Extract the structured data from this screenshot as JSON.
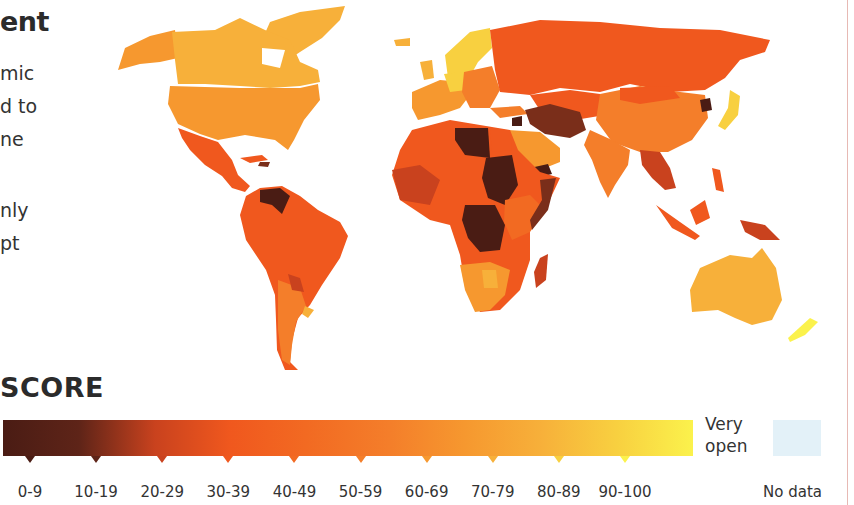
{
  "page": {
    "title_fragment": "ent",
    "body_fragments": [
      "mic",
      "d to",
      "ne",
      "",
      "nly",
      "pt"
    ]
  },
  "map": {
    "type": "choropleth-world-map",
    "description": "World countries shaded by openness score",
    "regions": [
      {
        "name": "North America (Canada)",
        "band": "70-79"
      },
      {
        "name": "United States",
        "band": "60-69"
      },
      {
        "name": "Greenland",
        "band": "70-79"
      },
      {
        "name": "Mexico / Central America",
        "band": "40-49"
      },
      {
        "name": "Venezuela",
        "band": "0-9"
      },
      {
        "name": "South America (Brazil, Colombia, Peru)",
        "band": "40-49"
      },
      {
        "name": "Argentina",
        "band": "50-59"
      },
      {
        "name": "Paraguay",
        "band": "20-29"
      },
      {
        "name": "Uruguay",
        "band": "70-79"
      },
      {
        "name": "Nordic countries",
        "band": "80-89"
      },
      {
        "name": "Western Europe",
        "band": "60-69"
      },
      {
        "name": "Eastern Europe",
        "band": "50-59"
      },
      {
        "name": "Russia",
        "band": "40-49"
      },
      {
        "name": "Central Asia",
        "band": "40-49"
      },
      {
        "name": "China",
        "band": "50-59"
      },
      {
        "name": "North Korea",
        "band": "0-9"
      },
      {
        "name": "Japan",
        "band": "80-89"
      },
      {
        "name": "India",
        "band": "50-59"
      },
      {
        "name": "Afghanistan / Iran",
        "band": "10-19"
      },
      {
        "name": "Saudi Arabia",
        "band": "60-69"
      },
      {
        "name": "Yemen",
        "band": "0-9"
      },
      {
        "name": "Libya",
        "band": "0-9"
      },
      {
        "name": "Sudan / South Sudan",
        "band": "0-9"
      },
      {
        "name": "DR Congo / CAR",
        "band": "0-9"
      },
      {
        "name": "North & West Africa",
        "band": "30-39"
      },
      {
        "name": "East Africa",
        "band": "40-49"
      },
      {
        "name": "Southern Africa",
        "band": "60-69"
      },
      {
        "name": "Madagascar",
        "band": "30-39"
      },
      {
        "name": "Southeast Asia",
        "band": "30-39"
      },
      {
        "name": "Indonesia / Papua New Guinea",
        "band": "30-39"
      },
      {
        "name": "Australia",
        "band": "70-79"
      },
      {
        "name": "New Zealand",
        "band": "90-100"
      }
    ]
  },
  "legend": {
    "heading": "SCORE",
    "bands": [
      "0-9",
      "10-19",
      "20-29",
      "30-39",
      "40-49",
      "50-59",
      "60-69",
      "70-79",
      "80-89",
      "90-100"
    ],
    "colors": [
      "#4a1c14",
      "#5e2418",
      "#c9421e",
      "#f0581e",
      "#f26a22",
      "#f47e2a",
      "#f6982f",
      "#f7b03a",
      "#f8d040",
      "#fbf24c"
    ],
    "open_label_line1": "Very",
    "open_label_line2": "open",
    "no_data_label": "No data",
    "no_data_color": "#e3f1f8"
  }
}
